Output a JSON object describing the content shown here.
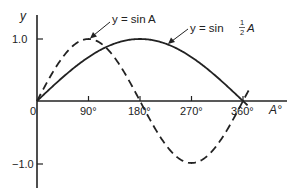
{
  "chart_data": {
    "type": "line",
    "title": "",
    "xlabel": "A°",
    "ylabel": "y",
    "xlim": [
      0,
      370
    ],
    "ylim": [
      -1.2,
      1.4
    ],
    "grid": false,
    "legend": "none (curves labelled by arrows)",
    "x_ticks": [
      {
        "value": 0,
        "label": "0"
      },
      {
        "value": 90,
        "label": "90°"
      },
      {
        "value": 180,
        "label": "180°"
      },
      {
        "value": 270,
        "label": "270°"
      },
      {
        "value": 360,
        "label": "360°"
      }
    ],
    "y_ticks": [
      {
        "value": 1.0,
        "label": "1.0"
      },
      {
        "value": -1.0,
        "label": "-1.0"
      }
    ],
    "series": [
      {
        "name": "y = sin A",
        "style": "dashed",
        "x": [
          0,
          45,
          90,
          135,
          180,
          225,
          270,
          315,
          360,
          370
        ],
        "values": [
          0,
          0.707,
          1.0,
          0.707,
          0,
          -0.707,
          -1.0,
          -0.707,
          0,
          0.17
        ]
      },
      {
        "name": "y = sin ½A",
        "style": "solid",
        "x": [
          0,
          45,
          90,
          135,
          180,
          225,
          270,
          315,
          360,
          368
        ],
        "values": [
          0,
          0.383,
          0.707,
          0.924,
          1.0,
          0.924,
          0.707,
          0.383,
          0,
          -0.07
        ]
      }
    ],
    "annotations": [
      {
        "text": "y = sin A",
        "points_to": "peak of sin A at 90°"
      },
      {
        "text": "y = sin ½A",
        "points_to": "sin ½A curve near 225°"
      }
    ]
  },
  "labels": {
    "y_axis": "y",
    "x_axis": "A°",
    "origin": "0",
    "x90": "90°",
    "x180": "180°",
    "x270": "270°",
    "x360": "360°",
    "y_pos": "1.0",
    "y_neg": "−1.0",
    "ann_sinA": "y = sin A",
    "ann_half_prefix": "y = sin ",
    "ann_half_num": "1",
    "ann_half_den": "2",
    "ann_half_suffix": "A"
  }
}
